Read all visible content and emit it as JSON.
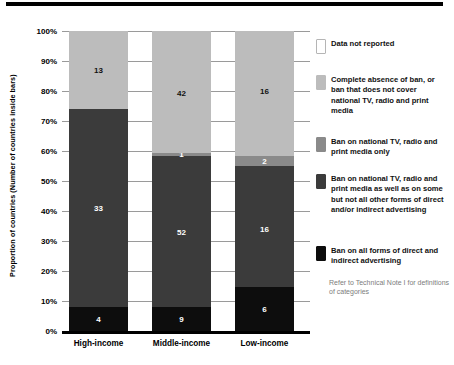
{
  "chart_data": {
    "type": "bar",
    "subtype": "stacked-percentage",
    "title": "",
    "xlabel": "",
    "ylabel": "Proportion of countries (Number of countries inside bars)",
    "ylim": [
      0,
      100
    ],
    "grid": true,
    "legend_position": "right",
    "categories": [
      "High-income",
      "Middle-income",
      "Low-income"
    ],
    "ytick_labels": [
      "0%",
      "10%",
      "20%",
      "30%",
      "40%",
      "50%",
      "60%",
      "70%",
      "80%",
      "90%",
      "100%"
    ],
    "ytick_values": [
      0,
      10,
      20,
      30,
      40,
      50,
      60,
      70,
      80,
      90,
      100
    ],
    "series": [
      {
        "name": "Ban on all forms of direct and indirect advertising",
        "color": "#0d0d0d",
        "label_color": "light",
        "values": [
          4,
          9,
          6
        ],
        "percent": [
          8.0,
          8.1,
          14.6
        ]
      },
      {
        "name": "Ban on national TV, radio and print media as well as on some but not all other forms of direct and/or indirect advertising",
        "color": "#3b3b3b",
        "label_color": "light",
        "values": [
          33,
          52,
          16
        ],
        "percent": [
          66.0,
          50.4,
          40.4
        ]
      },
      {
        "name": "Ban on national TV, radio and print media only",
        "color": "#8a8a8a",
        "label_color": "light",
        "values": [
          0,
          1,
          2
        ],
        "percent": [
          0.0,
          1.0,
          3.5
        ]
      },
      {
        "name": "Complete absence of ban, or ban that does not cover national TV, radio and print media",
        "color": "#bcbcbc",
        "label_color": "dark",
        "values": [
          13,
          42,
          16
        ],
        "percent": [
          26.0,
          40.5,
          41.5
        ]
      },
      {
        "name": "Data not reported",
        "color": "#ffffff",
        "label_color": "dark",
        "values": [
          0,
          0,
          0
        ],
        "percent": [
          0.0,
          0.0,
          0.0
        ]
      }
    ]
  },
  "axis": {
    "y_title": "Proportion of countries (Number of countries inside bars)",
    "ticks": [
      {
        "label": "100%",
        "value": 100
      },
      {
        "label": "90%",
        "value": 90
      },
      {
        "label": "80%",
        "value": 80
      },
      {
        "label": "70%",
        "value": 70
      },
      {
        "label": "60%",
        "value": 60
      },
      {
        "label": "50%",
        "value": 50
      },
      {
        "label": "40%",
        "value": 40
      },
      {
        "label": "30%",
        "value": 30
      },
      {
        "label": "20%",
        "value": 20
      },
      {
        "label": "10%",
        "value": 10
      },
      {
        "label": "0%",
        "value": 0
      }
    ]
  },
  "bars": [
    {
      "category": "High-income",
      "segments": [
        {
          "value": "4",
          "percent": 8.0,
          "color": "#0d0d0d",
          "label_color": "light",
          "label_at": 4.0
        },
        {
          "value": "33",
          "percent": 66.0,
          "color": "#3b3b3b",
          "label_color": "light",
          "label_at": 41.0
        },
        {
          "value": "13",
          "percent": 26.0,
          "color": "#bcbcbc",
          "label_color": "dark",
          "label_at": 87.0
        }
      ]
    },
    {
      "category": "Middle-income",
      "segments": [
        {
          "value": "9",
          "percent": 8.1,
          "color": "#0d0d0d",
          "label_color": "light",
          "label_at": 4.0
        },
        {
          "value": "52",
          "percent": 50.4,
          "color": "#3b3b3b",
          "label_color": "light",
          "label_at": 33.0
        },
        {
          "value": "1",
          "percent": 1.0,
          "color": "#8a8a8a",
          "label_color": "light",
          "label_at": 59.0
        },
        {
          "value": "42",
          "percent": 40.5,
          "color": "#bcbcbc",
          "label_color": "dark",
          "label_at": 79.5
        }
      ]
    },
    {
      "category": "Low-income",
      "segments": [
        {
          "value": "6",
          "percent": 14.6,
          "color": "#0d0d0d",
          "label_color": "light",
          "label_at": 7.3
        },
        {
          "value": "16",
          "percent": 40.4,
          "color": "#3b3b3b",
          "label_color": "light",
          "label_at": 34.0
        },
        {
          "value": "2",
          "percent": 3.5,
          "color": "#8a8a8a",
          "label_color": "light",
          "label_at": 56.8
        },
        {
          "value": "16",
          "percent": 41.5,
          "color": "#bcbcbc",
          "label_color": "dark",
          "label_at": 80.0
        }
      ]
    }
  ],
  "legend": {
    "items": [
      {
        "label": "Data not reported",
        "color": "#ffffff",
        "top": 8
      },
      {
        "label": "Complete absence of ban, or ban that does not cover national TV, radio and print media",
        "color": "#bcbcbc",
        "top": 44
      },
      {
        "label": "Ban on national TV, radio and print media only",
        "color": "#8a8a8a",
        "top": 106
      },
      {
        "label": "Ban on national TV, radio and print media as well as on some but not all other forms of direct and/or indirect advertising",
        "color": "#3b3b3b",
        "top": 143
      },
      {
        "label": "Ban on all forms of direct and indirect advertising",
        "color": "#0d0d0d",
        "top": 215
      }
    ],
    "note": "Refer to Technical Note I for definitions of categories"
  }
}
